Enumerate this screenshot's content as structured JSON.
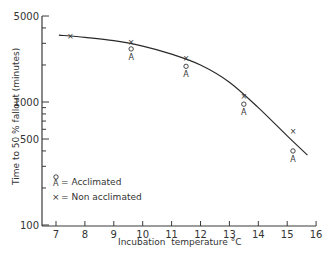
{
  "chart_data": {
    "type": "scatter",
    "title": "",
    "xlabel": "Incubation  temperature °C",
    "ylabel": "Time to 50 % fallout (minutes)",
    "xlim": [
      6.5,
      16
    ],
    "ylim": [
      100,
      5000
    ],
    "yscale": "log",
    "grid": false,
    "x_ticks": [
      7,
      8,
      9,
      10,
      11,
      12,
      13,
      14,
      15,
      16
    ],
    "y_ticks_labeled": [
      100,
      500,
      1000,
      5000
    ],
    "y_ticks_minor": [
      200,
      300,
      400,
      600,
      700,
      800,
      900,
      2000,
      3000,
      4000
    ],
    "series": [
      {
        "name": "Acclimated",
        "marker": "circle-A",
        "points": [
          [
            9.6,
            2700
          ],
          [
            11.5,
            1950
          ],
          [
            13.5,
            960
          ],
          [
            15.2,
            400
          ]
        ]
      },
      {
        "name": "Non acclimated",
        "marker": "x",
        "points": [
          [
            7.5,
            3450
          ],
          [
            9.6,
            3050
          ],
          [
            11.5,
            2300
          ],
          [
            13.5,
            1120
          ],
          [
            15.2,
            580
          ]
        ]
      }
    ],
    "fit_curve": {
      "name": "fitted curve",
      "points": [
        [
          7.1,
          3500
        ],
        [
          8,
          3350
        ],
        [
          9,
          3150
        ],
        [
          10,
          2850
        ],
        [
          11,
          2450
        ],
        [
          12,
          2000
        ],
        [
          13,
          1450
        ],
        [
          14,
          900
        ],
        [
          15,
          530
        ],
        [
          15.7,
          370
        ]
      ]
    },
    "legend": {
      "placement": "lower-left",
      "entries": [
        {
          "symbol": "A",
          "label": "= Acclimated"
        },
        {
          "symbol": "×",
          "label": "= Non acclimated"
        }
      ]
    }
  }
}
